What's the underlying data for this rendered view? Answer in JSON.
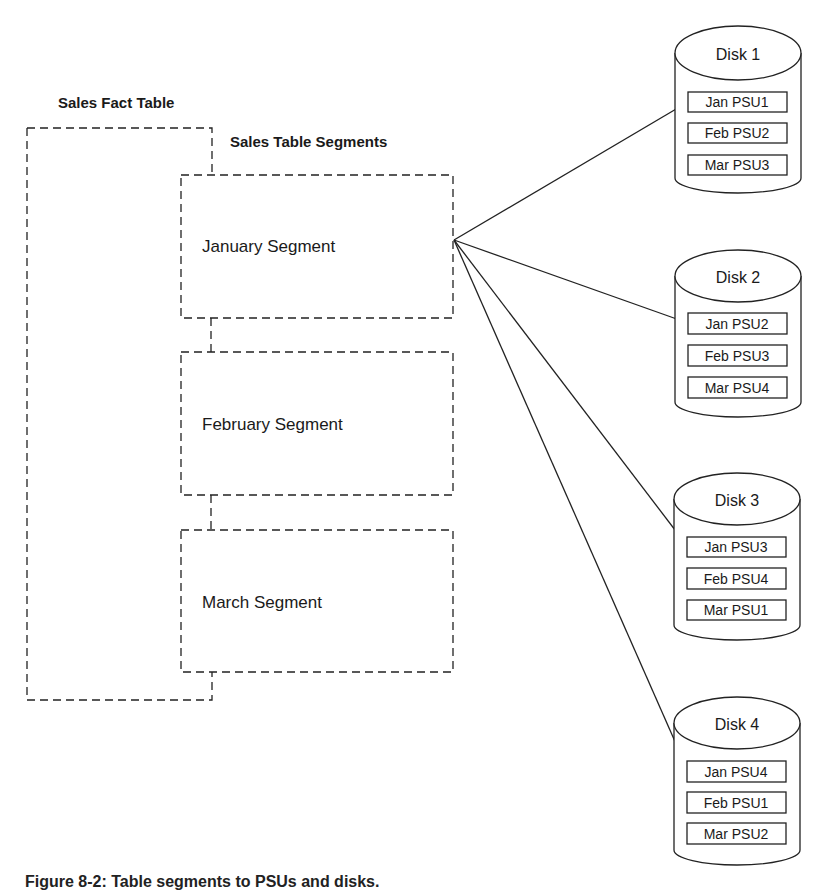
{
  "labels": {
    "fact_table": "Sales Fact Table",
    "segments_title": "Sales Table Segments"
  },
  "segments": [
    {
      "label": "January Segment"
    },
    {
      "label": "February Segment"
    },
    {
      "label": "March Segment"
    }
  ],
  "disks": [
    {
      "label": "Disk 1",
      "psus": [
        "Jan PSU1",
        "Feb PSU2",
        "Mar PSU3"
      ]
    },
    {
      "label": "Disk 2",
      "psus": [
        "Jan PSU2",
        "Feb PSU3",
        "Mar PSU4"
      ]
    },
    {
      "label": "Disk 3",
      "psus": [
        "Jan PSU3",
        "Feb PSU4",
        "Mar PSU1"
      ]
    },
    {
      "label": "Disk 4",
      "psus": [
        "Jan PSU4",
        "Feb PSU1",
        "Mar PSU2"
      ]
    }
  ],
  "caption": "Figure 8-2: Table segments to PSUs and disks."
}
